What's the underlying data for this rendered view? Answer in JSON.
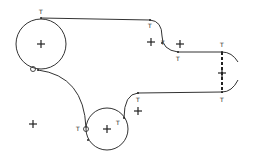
{
  "diagram": {
    "type": "cad-sketch",
    "stroke_color": "#333333",
    "background": "#ffffff",
    "constraint_label": "T",
    "circles": [
      {
        "name": "large-circle",
        "cx": 41,
        "cy": 44,
        "r": 25
      },
      {
        "name": "small-circle",
        "cx": 107,
        "cy": 129,
        "r": 21
      }
    ],
    "tangent_labels": [
      {
        "x": 39,
        "y": 14,
        "text": "T"
      },
      {
        "x": 148,
        "y": 28,
        "text": "T"
      },
      {
        "x": 161,
        "y": 45,
        "text": "T"
      },
      {
        "x": 176,
        "y": 61,
        "text": "T"
      },
      {
        "x": 220,
        "y": 47,
        "text": "T"
      },
      {
        "x": 220,
        "y": 102,
        "text": "T"
      },
      {
        "x": 136,
        "y": 102,
        "text": "T"
      },
      {
        "x": 116,
        "y": 125,
        "text": "T"
      },
      {
        "x": 76,
        "y": 131,
        "text": "T"
      }
    ],
    "center_marks": [
      {
        "x": 41,
        "y": 44
      },
      {
        "x": 151,
        "y": 42
      },
      {
        "x": 180,
        "y": 44
      },
      {
        "x": 222,
        "y": 73
      },
      {
        "x": 138,
        "y": 111
      },
      {
        "x": 107,
        "y": 129
      },
      {
        "x": 33,
        "y": 124
      }
    ]
  }
}
